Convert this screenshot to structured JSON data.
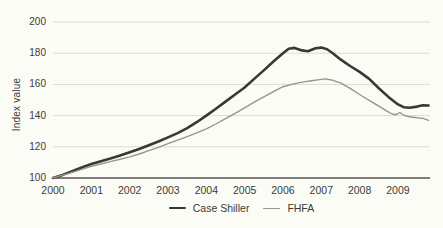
{
  "figure": {
    "background": "#fcfcf6",
    "text_color": "#3b3b36",
    "gridline_color": "#dddcd4",
    "axisline_color": "#56554e"
  },
  "chart_data": {
    "type": "line",
    "title": "",
    "xlabel": "",
    "ylabel": "Index value",
    "ylim": [
      100,
      200
    ],
    "xlim": [
      2000,
      2009.8
    ],
    "y_ticks": [
      100,
      120,
      140,
      160,
      180,
      200
    ],
    "x_ticks": [
      2000,
      2001,
      2002,
      2003,
      2004,
      2005,
      2006,
      2007,
      2008,
      2009
    ],
    "grid": "horizontal",
    "legend_position": "bottom-center",
    "series": [
      {
        "name": "Case Shiller",
        "color": "#393934",
        "stroke_width": 2.6,
        "points": [
          [
            2000,
            100
          ],
          [
            2000.25,
            102
          ],
          [
            2000.5,
            104.3
          ],
          [
            2000.75,
            106.7
          ],
          [
            2001,
            109
          ],
          [
            2001.25,
            110.8
          ],
          [
            2001.5,
            112.5
          ],
          [
            2001.75,
            114.4
          ],
          [
            2002,
            116.5
          ],
          [
            2002.25,
            118.6
          ],
          [
            2002.5,
            121
          ],
          [
            2002.75,
            123.4
          ],
          [
            2003,
            126
          ],
          [
            2003.25,
            128.8
          ],
          [
            2003.5,
            132
          ],
          [
            2003.75,
            135.8
          ],
          [
            2004,
            140
          ],
          [
            2004.25,
            144.4
          ],
          [
            2004.5,
            149
          ],
          [
            2004.75,
            153.5
          ],
          [
            2005,
            158
          ],
          [
            2005.25,
            163.5
          ],
          [
            2005.5,
            169
          ],
          [
            2005.75,
            174.7
          ],
          [
            2006,
            180
          ],
          [
            2006.15,
            182.8
          ],
          [
            2006.3,
            183.4
          ],
          [
            2006.5,
            181.8
          ],
          [
            2006.65,
            181.2
          ],
          [
            2006.85,
            183.2
          ],
          [
            2007,
            183.6
          ],
          [
            2007.15,
            182.5
          ],
          [
            2007.3,
            180
          ],
          [
            2007.5,
            176
          ],
          [
            2007.75,
            171.8
          ],
          [
            2008,
            168
          ],
          [
            2008.25,
            163.5
          ],
          [
            2008.5,
            157.5
          ],
          [
            2008.75,
            152
          ],
          [
            2009,
            147.2
          ],
          [
            2009.15,
            145.4
          ],
          [
            2009.3,
            145
          ],
          [
            2009.5,
            145.8
          ],
          [
            2009.65,
            146.6
          ],
          [
            2009.8,
            146.5
          ]
        ]
      },
      {
        "name": "FHFA",
        "color": "#97968c",
        "stroke_width": 1.4,
        "points": [
          [
            2000,
            100
          ],
          [
            2000.25,
            101.8
          ],
          [
            2000.5,
            103.6
          ],
          [
            2000.75,
            105.5
          ],
          [
            2001,
            107.5
          ],
          [
            2001.25,
            109
          ],
          [
            2001.5,
            110.5
          ],
          [
            2001.75,
            112
          ],
          [
            2002,
            113.5
          ],
          [
            2002.25,
            115.4
          ],
          [
            2002.5,
            117.5
          ],
          [
            2002.75,
            119.7
          ],
          [
            2003,
            122
          ],
          [
            2003.25,
            124.2
          ],
          [
            2003.5,
            126.5
          ],
          [
            2003.75,
            129
          ],
          [
            2004,
            131.5
          ],
          [
            2004.25,
            134.6
          ],
          [
            2004.5,
            138
          ],
          [
            2004.75,
            141.5
          ],
          [
            2005,
            145
          ],
          [
            2005.25,
            148.6
          ],
          [
            2005.5,
            152
          ],
          [
            2005.75,
            155.4
          ],
          [
            2006,
            158.5
          ],
          [
            2006.25,
            160.2
          ],
          [
            2006.5,
            161.5
          ],
          [
            2006.75,
            162.4
          ],
          [
            2007,
            163.2
          ],
          [
            2007.1,
            163.5
          ],
          [
            2007.3,
            162.6
          ],
          [
            2007.5,
            161
          ],
          [
            2007.75,
            157.5
          ],
          [
            2008,
            153.5
          ],
          [
            2008.25,
            149.8
          ],
          [
            2008.5,
            146
          ],
          [
            2008.7,
            143
          ],
          [
            2008.85,
            141
          ],
          [
            2008.95,
            140.6
          ],
          [
            2009.05,
            142
          ],
          [
            2009.15,
            140.2
          ],
          [
            2009.3,
            139.3
          ],
          [
            2009.5,
            138.6
          ],
          [
            2009.65,
            138.2
          ],
          [
            2009.8,
            137
          ]
        ]
      }
    ]
  }
}
